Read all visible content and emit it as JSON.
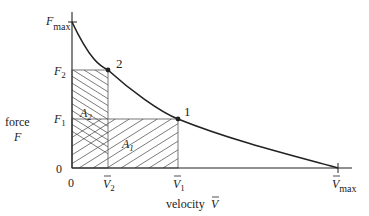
{
  "diagram": {
    "type": "force-velocity curve",
    "axes": {
      "y_label_line1": "force",
      "y_label_line2": "F",
      "x_label": "velocity",
      "x_label_symbol": "V",
      "origin_y": "0",
      "origin_x": "0"
    },
    "y_ticks": {
      "fmax": {
        "main": "F",
        "sub": "max"
      },
      "f2": {
        "main": "F",
        "sub": "2"
      },
      "f1": {
        "main": "F",
        "sub": "1"
      }
    },
    "x_ticks": {
      "v2": {
        "main": "V",
        "sub": "2"
      },
      "v1": {
        "main": "V",
        "sub": "1"
      },
      "vmax": {
        "main": "V",
        "sub": "max"
      }
    },
    "points": [
      {
        "id": "2",
        "label": "2",
        "velocity": "V2",
        "force": "F2"
      },
      {
        "id": "1",
        "label": "1",
        "velocity": "V1",
        "force": "F1"
      }
    ],
    "areas": [
      {
        "id": "A2",
        "main": "A",
        "sub": "2",
        "description": "rectangle 0..V2 x 0..F2"
      },
      {
        "id": "A1",
        "main": "A",
        "sub": "1",
        "description": "rectangle 0..V1 x 0..F1"
      }
    ],
    "colors": {
      "ink": "#222222",
      "hatch": "#444444",
      "background": "#ffffff"
    }
  }
}
